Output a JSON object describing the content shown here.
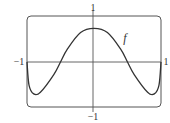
{
  "chart_data": {
    "type": "line",
    "title": "",
    "xlabel": "",
    "ylabel": "",
    "xlim": [
      -1,
      1
    ],
    "ylim": [
      -1,
      1
    ],
    "grid": false,
    "x_tick_labels": [
      "-1",
      "1"
    ],
    "y_tick_labels": [
      "1",
      "-1"
    ],
    "series": [
      {
        "name": "f",
        "x": [
          -1.0,
          -0.97,
          -0.9,
          -0.8,
          -0.6,
          -0.5,
          -0.4,
          -0.2,
          0.0,
          0.2,
          0.4,
          0.5,
          0.6,
          0.8,
          0.9,
          0.97,
          1.0
        ],
        "y": [
          0.0,
          -0.55,
          -0.76,
          -0.72,
          -0.3,
          0.0,
          0.3,
          0.7,
          0.8,
          0.7,
          0.3,
          0.0,
          -0.3,
          -0.72,
          -0.76,
          -0.55,
          0.0
        ]
      }
    ],
    "annotations": [
      {
        "text": "f",
        "x": 0.5,
        "y": 0.5
      }
    ]
  },
  "labels": {
    "y_top": "1",
    "y_bottom": "−1",
    "x_left": "−1",
    "x_right": "1",
    "curve": "f"
  }
}
